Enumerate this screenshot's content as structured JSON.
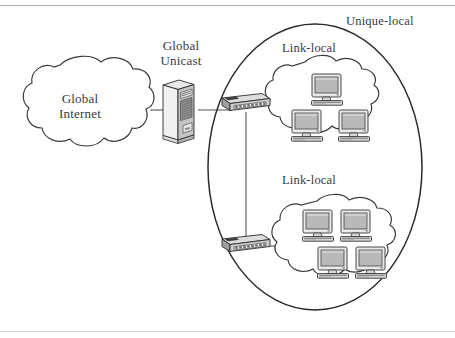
{
  "figure": {
    "background_color": "#ffffff",
    "stroke_color": "#2b2b2b",
    "text_color": "#3a3a3a",
    "width": 455,
    "height": 338
  },
  "labels": {
    "global_internet": "Global\nInternet",
    "global_unicast": "Global\nUnicast",
    "link_local_top": "Link-local",
    "link_local_bottom": "Link-local",
    "unique_local": "Unique-local"
  },
  "nodes": {
    "internet_cloud": {
      "name": "Global Internet",
      "shape": "cloud"
    },
    "server": {
      "name": "Global Unicast router/server",
      "shape": "tower-server"
    },
    "switch_top": {
      "name": "Top switch",
      "shape": "switch",
      "ports": 8
    },
    "switch_bottom": {
      "name": "Bottom switch",
      "shape": "switch",
      "ports": 8
    },
    "cloud_link_local_top": {
      "name": "Link-local segment (upper)",
      "shape": "cloud",
      "computer_count": 3
    },
    "cloud_link_local_bottom": {
      "name": "Link-local segment (lower)",
      "shape": "cloud",
      "computer_count": 4
    },
    "unique_local_boundary": {
      "name": "Unique-local scope",
      "shape": "ellipse"
    }
  },
  "links": [
    {
      "from": "internet_cloud",
      "to": "server"
    },
    {
      "from": "server",
      "to": "switch_top"
    },
    {
      "from": "switch_top",
      "to": "cloud_link_local_top"
    },
    {
      "from": "switch_top",
      "to": "switch_bottom"
    },
    {
      "from": "switch_bottom",
      "to": "cloud_link_local_bottom"
    }
  ],
  "colors": {
    "stroke": "#2b2b2b",
    "text": "#3a3a3a",
    "device_light": "#f2f2f2",
    "device_mid": "#c9c9c9",
    "device_dark": "#8a8a8a",
    "screen": "#bdbdbd",
    "rule": "#a8a8a8"
  }
}
